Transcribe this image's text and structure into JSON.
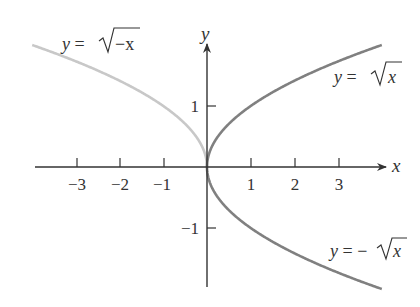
{
  "chart_data": {
    "type": "line",
    "title": "",
    "xlabel": "x",
    "ylabel": "y",
    "xlim": [
      -4,
      4
    ],
    "ylim": [
      -2,
      2
    ],
    "grid": false,
    "legend": "inline labels",
    "x_ticks": [
      -3,
      -2,
      -1,
      1,
      2,
      3
    ],
    "x_tick_labels": [
      "−3",
      "−2",
      "−1",
      "1",
      "2",
      "3"
    ],
    "y_ticks": [
      1,
      -1
    ],
    "y_tick_labels": [
      "1",
      "−1"
    ],
    "series": [
      {
        "name": "y = √−x",
        "color": "#c8c8c8",
        "x": [
          -4,
          -3,
          -2,
          -1,
          -0.5,
          -0.1,
          0
        ],
        "y": [
          2,
          1.732,
          1.414,
          1,
          0.707,
          0.316,
          0
        ]
      },
      {
        "name": "y = √x",
        "color": "#808080",
        "x": [
          0,
          0.1,
          0.5,
          1,
          2,
          3,
          4
        ],
        "y": [
          0,
          0.316,
          0.707,
          1,
          1.414,
          1.732,
          2
        ]
      },
      {
        "name": "y = −√x",
        "color": "#808080",
        "x": [
          0,
          0.1,
          0.5,
          1,
          2,
          3,
          4
        ],
        "y": [
          0,
          -0.316,
          -0.707,
          -1,
          -1.414,
          -1.732,
          -2
        ]
      }
    ],
    "annotations": [
      {
        "text": "y = √−x",
        "near": [
          -2.7,
          2
        ]
      },
      {
        "text": "y = √x",
        "near": [
          3.2,
          1.3
        ]
      },
      {
        "text": "y = −√x",
        "near": [
          3.2,
          -1.4
        ]
      }
    ]
  },
  "labels": {
    "x_axis": "x",
    "y_axis": "y",
    "curve_neg_sqrt_negx": {
      "prefix": "y = ",
      "radicand": "−x"
    },
    "curve_sqrt_x": {
      "prefix": "y = ",
      "radicand": "x"
    },
    "curve_neg_sqrt_x": {
      "prefix": "y = −",
      "radicand": "x"
    },
    "xticks": [
      "−3",
      "−2",
      "−1",
      "1",
      "2",
      "3"
    ],
    "yticks": [
      "1",
      "−1"
    ]
  },
  "colors": {
    "axis": "#333333",
    "curve_light": "#c8c8c8",
    "curve_dark": "#808080"
  }
}
